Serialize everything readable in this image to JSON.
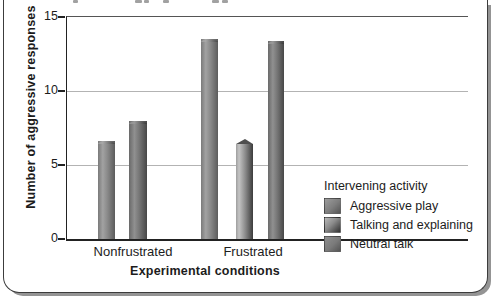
{
  "chart_data": {
    "type": "bar",
    "title": "",
    "categories": [
      "Nonfrustrated",
      "Frustrated"
    ],
    "series": [
      {
        "name": "Aggressive play",
        "color": "#848484",
        "values": [
          6.6,
          13.5
        ]
      },
      {
        "name": "Talking and explaining",
        "color": "#6e6e6e",
        "values": [
          null,
          6.4
        ]
      },
      {
        "name": "Neutral talk",
        "color": "#707070",
        "values": [
          8.0,
          13.4
        ]
      }
    ],
    "xlabel": "Experimental conditions",
    "ylabel": "Number of aggressive responses",
    "ylim": [
      0,
      15
    ],
    "yticks": [
      0,
      5,
      10,
      15
    ],
    "gridlines": [
      5,
      10
    ],
    "grid": "horizontal",
    "legend_title": "Intervening activity",
    "legend_position": "lower-right"
  },
  "frame": {
    "border_color": "#3c3c3c",
    "shadow_color": "#949494",
    "background": "#ffffff"
  }
}
